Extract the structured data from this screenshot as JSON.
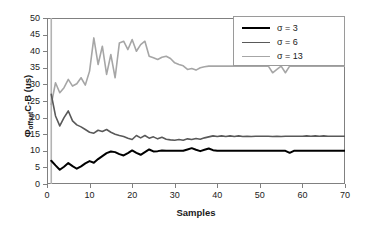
{
  "chart_data": {
    "type": "line",
    "title": "",
    "subtitle": "",
    "xlabel": "Samples",
    "ylabel": "ΦoffsetC-B (us)",
    "ylabel_main": "C-B (us)",
    "ylabel_symbol": "Φ",
    "ylabel_subscript": "offset",
    "xlim": [
      0,
      70
    ],
    "ylim": [
      0,
      50
    ],
    "xticks": [
      0,
      10,
      20,
      30,
      40,
      50,
      60,
      70
    ],
    "yticks": [
      0,
      5,
      10,
      15,
      20,
      25,
      30,
      35,
      40,
      45,
      50
    ],
    "grid": false,
    "legend_position": "top-right",
    "series": [
      {
        "name": "σ = 3",
        "color": "#000000",
        "width": 2.0,
        "x": [
          1,
          2,
          3,
          4,
          5,
          6,
          7,
          8,
          9,
          10,
          11,
          12,
          13,
          14,
          15,
          16,
          17,
          18,
          19,
          20,
          21,
          22,
          23,
          24,
          25,
          26,
          27,
          28,
          29,
          30,
          31,
          32,
          33,
          34,
          35,
          36,
          37,
          38,
          39,
          40,
          41,
          42,
          43,
          44,
          45,
          46,
          47,
          48,
          49,
          50,
          51,
          52,
          53,
          54,
          55,
          56,
          57,
          58,
          59,
          60,
          61,
          62,
          63,
          64,
          65,
          66,
          67,
          68,
          69,
          70
        ],
        "values": [
          7.0,
          5.6,
          4.3,
          5.2,
          6.3,
          5.4,
          4.6,
          5.3,
          6.2,
          6.9,
          6.4,
          7.5,
          8.4,
          9.3,
          9.8,
          9.6,
          9.0,
          8.6,
          9.3,
          10.1,
          9.4,
          8.8,
          9.6,
          10.4,
          9.8,
          9.9,
          10.1,
          10.0,
          10.0,
          10.0,
          10.0,
          10.0,
          10.4,
          10.8,
          10.3,
          9.9,
          10.3,
          10.7,
          10.2,
          10.0,
          10.0,
          10.0,
          10.0,
          10.0,
          10.0,
          10.0,
          10.0,
          10.0,
          10.0,
          10.0,
          10.0,
          10.0,
          10.0,
          10.0,
          10.0,
          10.0,
          9.4,
          10.0,
          10.0,
          10.0,
          10.0,
          10.0,
          10.0,
          10.0,
          10.0,
          10.0,
          10.0,
          10.0,
          10.0,
          10.0
        ]
      },
      {
        "name": "σ = 6",
        "color": "#595959",
        "width": 1.6,
        "x": [
          1,
          2,
          3,
          4,
          5,
          6,
          7,
          8,
          9,
          10,
          11,
          12,
          13,
          14,
          15,
          16,
          17,
          18,
          19,
          20,
          21,
          22,
          23,
          24,
          25,
          26,
          27,
          28,
          29,
          30,
          31,
          32,
          33,
          34,
          35,
          36,
          37,
          38,
          39,
          40,
          41,
          42,
          43,
          44,
          45,
          46,
          47,
          48,
          49,
          50,
          51,
          52,
          53,
          54,
          55,
          56,
          57,
          58,
          59,
          60,
          61,
          62,
          63,
          64,
          65,
          66,
          67,
          68,
          69,
          70
        ],
        "values": [
          27.0,
          20.5,
          17.5,
          20.0,
          22.0,
          19.0,
          17.8,
          17.2,
          16.4,
          15.6,
          15.3,
          16.2,
          15.8,
          16.4,
          15.6,
          15.0,
          14.6,
          14.3,
          13.8,
          13.4,
          14.6,
          13.9,
          14.6,
          13.8,
          14.2,
          13.6,
          14.1,
          13.5,
          13.3,
          13.2,
          13.4,
          13.2,
          13.6,
          13.4,
          13.7,
          13.5,
          13.9,
          14.2,
          14.5,
          14.3,
          14.5,
          14.3,
          14.5,
          14.3,
          14.5,
          14.3,
          14.4,
          14.3,
          14.4,
          14.4,
          14.4,
          14.4,
          14.3,
          14.4,
          14.3,
          14.4,
          14.4,
          14.4,
          14.4,
          14.4,
          14.5,
          14.4,
          14.5,
          14.4,
          14.5,
          14.4,
          14.4,
          14.4,
          14.4,
          14.4
        ]
      },
      {
        "name": "σ = 13",
        "color": "#a6a6a6",
        "width": 1.6,
        "x": [
          1,
          2,
          3,
          4,
          5,
          6,
          7,
          8,
          9,
          10,
          11,
          12,
          13,
          14,
          15,
          16,
          17,
          18,
          19,
          20,
          21,
          22,
          23,
          24,
          25,
          26,
          27,
          28,
          29,
          30,
          31,
          32,
          33,
          34,
          35,
          36,
          37,
          38,
          39,
          40,
          41,
          42,
          43,
          44,
          45,
          46,
          47,
          48,
          49,
          50,
          51,
          52,
          53,
          54,
          55,
          56,
          57,
          58,
          59,
          60,
          61,
          62,
          63,
          64,
          65,
          66,
          67,
          68,
          69,
          70
        ],
        "values": [
          24.0,
          30.5,
          27.5,
          29.0,
          31.5,
          29.5,
          30.2,
          32.0,
          29.8,
          34.0,
          44.0,
          36.0,
          41.5,
          33.0,
          39.0,
          32.0,
          42.5,
          43.0,
          40.5,
          43.5,
          40.0,
          42.0,
          43.0,
          38.5,
          38.0,
          37.5,
          38.2,
          38.5,
          37.8,
          36.5,
          36.0,
          35.6,
          34.5,
          34.8,
          34.3,
          35.0,
          35.3,
          35.5,
          35.5,
          35.5,
          35.5,
          35.5,
          35.5,
          35.5,
          35.5,
          35.5,
          35.5,
          35.5,
          35.5,
          35.5,
          35.5,
          35.5,
          33.5,
          34.5,
          35.5,
          33.5,
          35.5,
          35.5,
          35.5,
          35.5,
          35.5,
          35.5,
          35.5,
          35.5,
          35.5,
          35.5,
          35.5,
          35.5,
          35.5,
          35.5
        ]
      }
    ],
    "marker_line": {
      "name": "initial-sample-marker",
      "x": 1.0,
      "color": "#b3b3b3"
    }
  },
  "legend": {
    "entries": [
      {
        "label": "σ = 3",
        "color": "#000000"
      },
      {
        "label": "σ = 6",
        "color": "#595959"
      },
      {
        "label": "σ = 13",
        "color": "#a6a6a6"
      }
    ]
  },
  "axes": {
    "y_tick_labels": [
      "50",
      "45",
      "40",
      "35",
      "30",
      "25",
      "20",
      "15",
      "10",
      "5",
      "0"
    ],
    "x_tick_labels": [
      "0",
      "10",
      "20",
      "30",
      "40",
      "50",
      "60",
      "70"
    ],
    "x_title": "Samples"
  },
  "colors": {
    "frame": "#808080",
    "text": "#1a1a1a",
    "series_1": "#000000",
    "series_2": "#595959",
    "series_3": "#a6a6a6"
  }
}
